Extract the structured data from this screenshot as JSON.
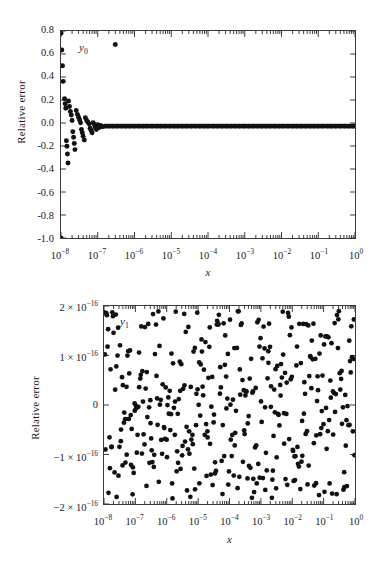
{
  "figure": {
    "background_color": "#ffffff",
    "marker_color": "#111111",
    "axis_color": "#3a3a3a"
  },
  "panels": [
    {
      "id": "top",
      "series_tag": "y",
      "series_tag_sub": "0",
      "ylabel": "Relative error",
      "xlabel": "x",
      "ytick_labels": [
        "0.8",
        "0.6",
        "0.4",
        "0.2",
        "0.0",
        "-0.2",
        "-0.4",
        "-0.6",
        "-0.8",
        "-1.0"
      ],
      "xtick_labels": [
        {
          "mant": "10",
          "exp": "−8"
        },
        {
          "mant": "10",
          "exp": "−7"
        },
        {
          "mant": "10",
          "exp": "−6"
        },
        {
          "mant": "10",
          "exp": "−5"
        },
        {
          "mant": "10",
          "exp": "−4"
        },
        {
          "mant": "10",
          "exp": "−3"
        },
        {
          "mant": "10",
          "exp": "−2"
        },
        {
          "mant": "10",
          "exp": "−1"
        },
        {
          "mant": "10",
          "exp": "0"
        }
      ]
    },
    {
      "id": "bottom",
      "series_tag": "y",
      "series_tag_sub": "1",
      "ylabel": "Relative error",
      "xlabel": "x",
      "ytick_labels": [
        {
          "text": "2 × 10",
          "exp": "−16"
        },
        {
          "text": "1 × 10",
          "exp": "−16"
        },
        {
          "text": "0",
          "exp": ""
        },
        {
          "text": "−1 × 10",
          "exp": "−16"
        },
        {
          "text": "−2 × 10",
          "exp": "−16"
        }
      ],
      "xtick_labels": [
        {
          "mant": "10",
          "exp": "−8"
        },
        {
          "mant": "10",
          "exp": "−7"
        },
        {
          "mant": "10",
          "exp": "−6"
        },
        {
          "mant": "10",
          "exp": "−5"
        },
        {
          "mant": "10",
          "exp": "−4"
        },
        {
          "mant": "10",
          "exp": "−3"
        },
        {
          "mant": "10",
          "exp": "−2"
        },
        {
          "mant": "10",
          "exp": "−1"
        },
        {
          "mant": "10",
          "exp": "0"
        }
      ]
    }
  ],
  "chart_data": [
    {
      "type": "scatter",
      "title": "",
      "series_name": "y0",
      "xlabel": "x",
      "ylabel": "Relative error",
      "xscale": "log",
      "xlim": [
        1e-08,
        1.0
      ],
      "ylim": [
        -1.0,
        0.85
      ],
      "yticks": [
        0.8,
        0.6,
        0.4,
        0.2,
        0.0,
        -0.2,
        -0.4,
        -0.6,
        -0.8,
        -1.0
      ],
      "xticks": [
        1e-08,
        1e-07,
        1e-06,
        1e-05,
        0.0001,
        0.001,
        0.01,
        0.1,
        1.0
      ],
      "grid": false,
      "legend": "inside-top-left",
      "description": "Relative error of y0 versus x on a log x-axis. Error is catastrophically large (between -1.0 and +0.83) for x below about 1e-7, funnelling down to zero, then a dense flat band at 0 for all x above roughly 1e-7. One isolated outlier near x=3e-7 at +0.73.",
      "points": [
        [
          1e-08,
          0.83
        ],
        [
          1e-08,
          -1.0
        ],
        [
          1.05e-08,
          0.68
        ],
        [
          1.1e-08,
          0.54
        ],
        [
          1.15e-08,
          0.4
        ],
        [
          1.25e-08,
          0.245
        ],
        [
          1.3e-08,
          0.2
        ],
        [
          1.35e-08,
          0.16
        ],
        [
          1.4e-08,
          -0.13
        ],
        [
          1.45e-08,
          -0.18
        ],
        [
          1.5e-08,
          -0.25
        ],
        [
          1.55e-08,
          -0.33
        ],
        [
          1.6e-08,
          0.225
        ],
        [
          1.7e-08,
          0.175
        ],
        [
          1.8e-08,
          0.13
        ],
        [
          1.9e-08,
          0.1
        ],
        [
          2e-08,
          0.05
        ],
        [
          2.1e-08,
          -0.05
        ],
        [
          2.2e-08,
          -0.1
        ],
        [
          2.3e-08,
          -0.155
        ],
        [
          2.4e-08,
          -0.21
        ],
        [
          2.6e-08,
          0.14
        ],
        [
          2.8e-08,
          0.105
        ],
        [
          3e-08,
          0.08
        ],
        [
          3.2e-08,
          0.055
        ],
        [
          3.4e-08,
          0.03
        ],
        [
          3.6e-08,
          -0.03
        ],
        [
          3.8e-08,
          -0.06
        ],
        [
          4e-08,
          -0.09
        ],
        [
          4.3e-08,
          -0.125
        ],
        [
          4.6e-08,
          0.075
        ],
        [
          5e-08,
          0.05
        ],
        [
          5.4e-08,
          0.035
        ],
        [
          5.8e-08,
          0.02
        ],
        [
          6.2e-08,
          -0.02
        ],
        [
          6.6e-08,
          -0.04
        ],
        [
          7e-08,
          -0.06
        ],
        [
          7.5e-08,
          0.03
        ],
        [
          8e-08,
          0.015
        ],
        [
          8.6e-08,
          -0.015
        ],
        [
          9.2e-08,
          -0.03
        ],
        [
          1e-07,
          0.012
        ],
        [
          1.1e-07,
          -0.012
        ],
        [
          1.2e-07,
          0.006
        ],
        [
          1.35e-07,
          -0.006
        ],
        [
          3e-07,
          0.73
        ],
        [
          1.6e-07,
          0.0
        ],
        [
          2e-07,
          0.0
        ],
        [
          2.6e-07,
          0.0
        ],
        [
          3.4e-07,
          0.0
        ],
        [
          4.4e-07,
          0.0
        ],
        [
          5.8e-07,
          0.0
        ],
        [
          7.5e-07,
          0.0
        ],
        [
          1e-06,
          0.0
        ],
        [
          1.3e-06,
          0.0
        ],
        [
          1.7e-06,
          0.0
        ],
        [
          2.2e-06,
          0.0
        ],
        [
          3e-06,
          0.0
        ],
        [
          4e-06,
          0.0
        ],
        [
          5.2e-06,
          0.0
        ],
        [
          6.8e-06,
          0.0
        ],
        [
          9e-06,
          0.0
        ],
        [
          1.2e-05,
          0.0
        ],
        [
          1.5e-05,
          0.0
        ],
        [
          2e-05,
          0.0
        ],
        [
          2.6e-05,
          0.0
        ],
        [
          3.5e-05,
          0.0
        ],
        [
          4.6e-05,
          0.0
        ],
        [
          6e-05,
          0.0
        ],
        [
          8e-05,
          0.0
        ],
        [
          0.0001,
          0.0
        ],
        [
          0.00014,
          0.0
        ],
        [
          0.00018,
          0.0
        ],
        [
          0.00024,
          0.0
        ],
        [
          0.00032,
          0.0
        ],
        [
          0.00042,
          0.0
        ],
        [
          0.00055,
          0.0
        ],
        [
          0.00072,
          0.0
        ],
        [
          0.00095,
          0.0
        ],
        [
          0.0013,
          0.0
        ],
        [
          0.0017,
          0.0
        ],
        [
          0.0022,
          0.0
        ],
        [
          0.0029,
          0.0
        ],
        [
          0.0038,
          0.0
        ],
        [
          0.005,
          0.0
        ],
        [
          0.0066,
          0.0
        ],
        [
          0.0087,
          0.0
        ],
        [
          0.011,
          0.0
        ],
        [
          0.015,
          0.0
        ],
        [
          0.02,
          0.0
        ],
        [
          0.026,
          0.0
        ],
        [
          0.034,
          0.0
        ],
        [
          0.045,
          0.0
        ],
        [
          0.06,
          0.0
        ],
        [
          0.078,
          0.0
        ],
        [
          0.1,
          0.0
        ],
        [
          0.13,
          0.0
        ],
        [
          0.18,
          0.0
        ],
        [
          0.23,
          0.0
        ],
        [
          0.3,
          0.0
        ],
        [
          0.4,
          0.0
        ],
        [
          0.52,
          0.0
        ],
        [
          0.68,
          0.0
        ],
        [
          0.85,
          0.0
        ],
        [
          1.0,
          0.0
        ]
      ]
    },
    {
      "type": "scatter",
      "title": "",
      "series_name": "y1",
      "xlabel": "x",
      "ylabel": "Relative error",
      "xscale": "log",
      "xlim": [
        1e-08,
        1.0
      ],
      "ylim": [
        -2e-16,
        2e-16
      ],
      "yticks": [
        2e-16,
        1e-16,
        0,
        -1e-16,
        -2e-16
      ],
      "xticks": [
        1e-08,
        1e-07,
        1e-06,
        1e-05,
        0.0001,
        0.001,
        0.01,
        0.1,
        1.0
      ],
      "grid": false,
      "legend": "inside-top-left",
      "description": "Relative error of y1 versus x on a log x-axis. Error is pure rounding noise, uniformly scattered between about -2e-16 and +2e-16 across the whole range, with no systematic trend. Roughly 400 points.",
      "noise_band": [
        -1.9e-16,
        1.9e-16
      ],
      "point_count": 400
    }
  ]
}
